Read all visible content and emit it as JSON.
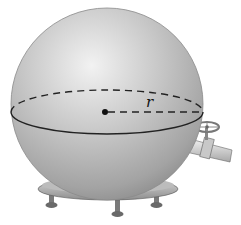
{
  "diagram": {
    "labels": {
      "radius": "r"
    },
    "colors": {
      "sphere_light": "#e6e6e6",
      "sphere_mid": "#b8b8b8",
      "sphere_dark": "#8a8a8a",
      "outline": "#222222",
      "background": "#ffffff"
    }
  }
}
